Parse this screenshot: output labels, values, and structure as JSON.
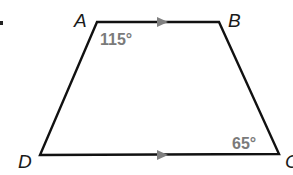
{
  "figure": {
    "type": "trapezoid",
    "colors": {
      "edge": "#111111",
      "parallel_marker": "#808080",
      "angle_label": "#7a7a7a",
      "vertex_label": "#1a1a1a"
    },
    "vertices": [
      {
        "name": "A",
        "x": 97,
        "y": 22
      },
      {
        "name": "B",
        "x": 219,
        "y": 22
      },
      {
        "name": "C",
        "x": 279,
        "y": 154
      },
      {
        "name": "D",
        "x": 40,
        "y": 155
      }
    ],
    "vertex_labels": {
      "A": "A",
      "B": "B",
      "C": "C",
      "D": "D"
    },
    "angles": {
      "A": "115°",
      "C": "65°"
    },
    "parallel_sides": [
      "AB",
      "DC"
    ]
  }
}
